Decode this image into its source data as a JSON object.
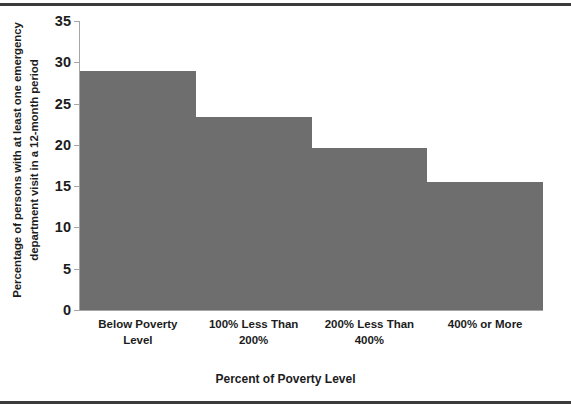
{
  "chart_data": {
    "type": "bar",
    "title": "",
    "subtitle": "",
    "xlabel": "Percent of Poverty Level",
    "ylabel": "Percentage of persons with at least one emergency department visit in a 12-month period",
    "ylabel_line1": "Percentage of persons with at least one emergency",
    "ylabel_line2": "department visit in a 12-month period",
    "categories": [
      "Below Poverty Level",
      "100% Less Than 200%",
      "200% Less Than 400%",
      "400% or More"
    ],
    "category_lines": [
      [
        "Below Poverty",
        "Level"
      ],
      [
        "100% Less Than",
        "200%"
      ],
      [
        "200% Less Than",
        "400%"
      ],
      [
        "400% or More",
        ""
      ]
    ],
    "values": [
      29.0,
      23.4,
      19.6,
      15.5
    ],
    "ylim": [
      0,
      35
    ],
    "ytick_values": [
      0,
      5,
      10,
      15,
      20,
      25,
      30,
      35
    ],
    "ytick_labels": [
      "0",
      "5",
      "10",
      "15",
      "20",
      "25",
      "30",
      "35"
    ],
    "grid": false,
    "legend": "none",
    "bar_color": "#6e6e6e",
    "bar_gap": 0,
    "axis_color": "#a6a6a6",
    "text_color": "#1c1c1c",
    "background": "#ffffff",
    "border_color": "#3b3b3b"
  }
}
